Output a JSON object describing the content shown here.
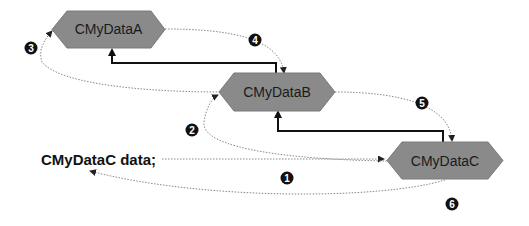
{
  "diagram": {
    "colors": {
      "node_fill": "#8a8a8a",
      "solid_line": "#111111",
      "dotted_line": "#888888",
      "badge_fill": "#111111",
      "badge_text": "#ffffff"
    },
    "nodes": [
      {
        "id": "A",
        "label": "CMyDataA"
      },
      {
        "id": "B",
        "label": "CMyDataB"
      },
      {
        "id": "C",
        "label": "CMyDataC"
      }
    ],
    "code_label": "CMyDataC data;",
    "steps": [
      {
        "number": "1",
        "description": "declaration to CMyDataC"
      },
      {
        "number": "2",
        "description": "CMyDataC to CMyDataB"
      },
      {
        "number": "3",
        "description": "CMyDataB to CMyDataA"
      },
      {
        "number": "4",
        "description": "CMyDataA back to CMyDataB"
      },
      {
        "number": "5",
        "description": "CMyDataB back to CMyDataC"
      },
      {
        "number": "6",
        "description": "CMyDataC back to declaration"
      }
    ],
    "inheritance_edges": [
      {
        "from": "B",
        "to": "A",
        "style": "solid"
      },
      {
        "from": "C",
        "to": "B",
        "style": "solid"
      }
    ]
  }
}
